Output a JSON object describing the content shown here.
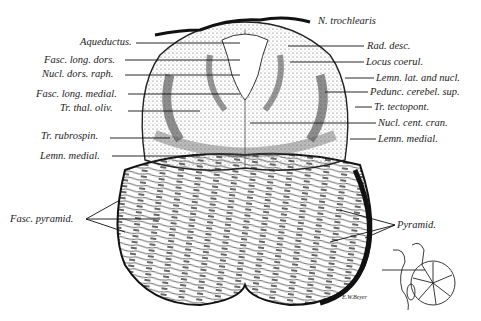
{
  "figure": {
    "signature": "E.W.Beyer",
    "labels_left": [
      {
        "text": "Aqueductus.",
        "x": 80,
        "y": 37
      },
      {
        "text": "Fasc. long. dors.",
        "x": 44,
        "y": 56
      },
      {
        "text": "Nucl. dors. raph.",
        "x": 42,
        "y": 69
      },
      {
        "text": "Fasc. long. medial.",
        "x": 36,
        "y": 91
      },
      {
        "text": "Tr. thal. oliv.",
        "x": 60,
        "y": 102
      },
      {
        "text": "Tr. rubrospin.",
        "x": 41,
        "y": 131
      },
      {
        "text": "Lemn. medial.",
        "x": 40,
        "y": 153
      },
      {
        "text": "Fasc. pyramid.",
        "x": 10,
        "y": 216
      }
    ],
    "labels_right": [
      {
        "text": "N. trochlearis",
        "x": 318,
        "y": 17
      },
      {
        "text": "Rad. desc.",
        "x": 367,
        "y": 41
      },
      {
        "text": "Locus coerul.",
        "x": 366,
        "y": 57
      },
      {
        "text": "Lemn. lat. and nucl.",
        "x": 376,
        "y": 74
      },
      {
        "text": "Pedunc. cerebel. sup.",
        "x": 370,
        "y": 88
      },
      {
        "text": "Tr. tectopont.",
        "x": 374,
        "y": 103
      },
      {
        "text": "Nucl. cent. cran.",
        "x": 378,
        "y": 119
      },
      {
        "text": "Lemn. medial.",
        "x": 378,
        "y": 135
      },
      {
        "text": "Pyramid.",
        "x": 397,
        "y": 222
      }
    ]
  }
}
